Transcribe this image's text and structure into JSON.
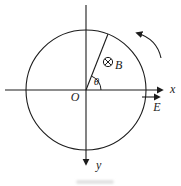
{
  "diagram": {
    "labels": {
      "origin": "O",
      "x_axis": "x",
      "y_axis": "y",
      "angle": "θ",
      "magnetic_field": "B",
      "electric_field": "E"
    },
    "symbols": {
      "field_direction": "circle-with-cross-into-page",
      "rotation_direction": "counterclockwise"
    },
    "colors": {
      "line": "#1c1c1c",
      "background": "#ffffff"
    }
  }
}
